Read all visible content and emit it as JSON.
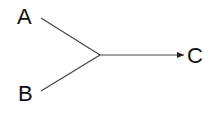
{
  "diagram": {
    "nodes": [
      {
        "id": "A",
        "label": "A"
      },
      {
        "id": "B",
        "label": "B"
      },
      {
        "id": "C",
        "label": "C"
      }
    ],
    "edges": [
      {
        "from": "A",
        "to": "junction"
      },
      {
        "from": "B",
        "to": "junction"
      },
      {
        "from": "junction",
        "to": "C",
        "arrow": true
      }
    ],
    "line_color": "#333333",
    "text_color": "#111111"
  }
}
